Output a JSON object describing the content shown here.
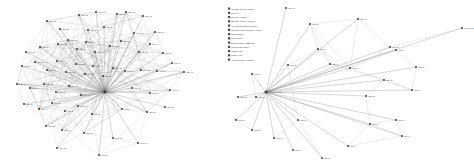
{
  "figure": {
    "background": "#ffffff",
    "panel_count": 2,
    "node_color": "#3a3a3a",
    "edge_color": "#9a9a9a"
  },
  "chart_data": [
    {
      "type": "scatter",
      "id": "left-network",
      "title": "",
      "xlabel": "",
      "ylabel": "",
      "grid": false,
      "legend": "none",
      "description": "Dense force-directed network graph, hairball topology",
      "xlim": [
        0,
        230
      ],
      "ylim": [
        0,
        166
      ],
      "node_count": 62,
      "edge_count": 318,
      "nodes": [
        {
          "id": 0,
          "x": 47,
          "y": 21,
          "label": "node a1"
        },
        {
          "id": 1,
          "x": 79,
          "y": 15,
          "label": "node a2"
        },
        {
          "id": 2,
          "x": 96,
          "y": 12,
          "label": "node a3"
        },
        {
          "id": 3,
          "x": 117,
          "y": 14,
          "label": "node a4"
        },
        {
          "id": 4,
          "x": 126,
          "y": 12,
          "label": "node a5"
        },
        {
          "id": 5,
          "x": 143,
          "y": 16,
          "label": "node a6"
        },
        {
          "id": 6,
          "x": 60,
          "y": 29,
          "label": "node a7"
        },
        {
          "id": 7,
          "x": 88,
          "y": 30,
          "label": "node a8"
        },
        {
          "id": 8,
          "x": 104,
          "y": 27,
          "label": "node a9"
        },
        {
          "id": 9,
          "x": 134,
          "y": 33,
          "label": "node b1"
        },
        {
          "id": 10,
          "x": 155,
          "y": 32,
          "label": "node b2"
        },
        {
          "id": 11,
          "x": 26,
          "y": 52,
          "label": "node b3"
        },
        {
          "id": 12,
          "x": 40,
          "y": 47,
          "label": "node b4"
        },
        {
          "id": 13,
          "x": 58,
          "y": 44,
          "label": "node b5"
        },
        {
          "id": 14,
          "x": 68,
          "y": 40,
          "label": "node b6"
        },
        {
          "id": 15,
          "x": 77,
          "y": 49,
          "label": "node b7"
        },
        {
          "id": 16,
          "x": 86,
          "y": 42,
          "label": "node b8"
        },
        {
          "id": 17,
          "x": 95,
          "y": 52,
          "label": "node b9"
        },
        {
          "id": 18,
          "x": 110,
          "y": 46,
          "label": "node c1"
        },
        {
          "id": 19,
          "x": 121,
          "y": 41,
          "label": "node c2"
        },
        {
          "id": 20,
          "x": 139,
          "y": 52,
          "label": "node c3"
        },
        {
          "id": 21,
          "x": 150,
          "y": 44,
          "label": "node c4"
        },
        {
          "id": 22,
          "x": 163,
          "y": 53,
          "label": "node c5"
        },
        {
          "id": 23,
          "x": 22,
          "y": 66,
          "label": "node c6"
        },
        {
          "id": 24,
          "x": 35,
          "y": 62,
          "label": "node c7"
        },
        {
          "id": 25,
          "x": 47,
          "y": 70,
          "label": "node c8"
        },
        {
          "id": 26,
          "x": 57,
          "y": 61,
          "label": "node c9"
        },
        {
          "id": 27,
          "x": 66,
          "y": 72,
          "label": "node d1"
        },
        {
          "id": 28,
          "x": 76,
          "y": 64,
          "label": "node d2"
        },
        {
          "id": 29,
          "x": 85,
          "y": 74,
          "label": "node d3"
        },
        {
          "id": 30,
          "x": 93,
          "y": 66,
          "label": "node d4"
        },
        {
          "id": 31,
          "x": 103,
          "y": 76,
          "label": "node d5"
        },
        {
          "id": 32,
          "x": 113,
          "y": 68,
          "label": "node d6"
        },
        {
          "id": 33,
          "x": 125,
          "y": 71,
          "label": "node d7"
        },
        {
          "id": 34,
          "x": 141,
          "y": 70,
          "label": "node d8"
        },
        {
          "id": 35,
          "x": 157,
          "y": 71,
          "label": "node d9"
        },
        {
          "id": 36,
          "x": 172,
          "y": 63,
          "label": "node e1"
        },
        {
          "id": 37,
          "x": 184,
          "y": 72,
          "label": "node e2"
        },
        {
          "id": 38,
          "x": 17,
          "y": 84,
          "label": "node e3"
        },
        {
          "id": 39,
          "x": 30,
          "y": 88,
          "label": "node e4"
        },
        {
          "id": 40,
          "x": 44,
          "y": 84,
          "label": "node e5"
        },
        {
          "id": 41,
          "x": 56,
          "y": 92,
          "label": "node e6"
        },
        {
          "id": 42,
          "x": 69,
          "y": 86,
          "label": "node e7"
        },
        {
          "id": 43,
          "x": 81,
          "y": 95,
          "label": "node e8"
        },
        {
          "id": 44,
          "x": 105,
          "y": 92,
          "label": "hub node"
        },
        {
          "id": 45,
          "x": 132,
          "y": 88,
          "label": "node e9"
        },
        {
          "id": 46,
          "x": 150,
          "y": 93,
          "label": "node f1"
        },
        {
          "id": 47,
          "x": 170,
          "y": 90,
          "label": "node f2"
        },
        {
          "id": 48,
          "x": 24,
          "y": 104,
          "label": "node f3"
        },
        {
          "id": 49,
          "x": 39,
          "y": 109,
          "label": "node f4"
        },
        {
          "id": 50,
          "x": 52,
          "y": 103,
          "label": "node f5"
        },
        {
          "id": 51,
          "x": 65,
          "y": 111,
          "label": "node f6"
        },
        {
          "id": 52,
          "x": 78,
          "y": 106,
          "label": "node f7"
        },
        {
          "id": 53,
          "x": 92,
          "y": 114,
          "label": "node f8"
        },
        {
          "id": 54,
          "x": 122,
          "y": 109,
          "label": "node f9"
        },
        {
          "id": 55,
          "x": 147,
          "y": 112,
          "label": "node g1"
        },
        {
          "id": 56,
          "x": 165,
          "y": 107,
          "label": "node g2"
        },
        {
          "id": 57,
          "x": 46,
          "y": 126,
          "label": "node g3"
        },
        {
          "id": 58,
          "x": 62,
          "y": 130,
          "label": "node g4"
        },
        {
          "id": 59,
          "x": 84,
          "y": 133,
          "label": "node g5"
        },
        {
          "id": 60,
          "x": 113,
          "y": 138,
          "label": "node g6"
        },
        {
          "id": 61,
          "x": 138,
          "y": 143,
          "label": "node g7"
        },
        {
          "id": 62,
          "x": 57,
          "y": 148,
          "label": "node g8"
        },
        {
          "id": 63,
          "x": 99,
          "y": 155,
          "label": "node g9"
        }
      ]
    },
    {
      "type": "scatter",
      "id": "right-network",
      "title": "",
      "xlabel": "",
      "ylabel": "",
      "grid": false,
      "legend": "upper-left",
      "description": "Sparse hub-and-spoke network graph with category legend",
      "xlim": [
        0,
        244
      ],
      "ylim": [
        0,
        166
      ],
      "node_count": 28,
      "edge_count": 56,
      "nodes": [
        {
          "id": 0,
          "x": 36,
          "y": 92,
          "label": "central hub node"
        },
        {
          "id": 1,
          "x": 120,
          "y": 68,
          "label": "node r1"
        },
        {
          "id": 2,
          "x": 80,
          "y": 24,
          "label": "node r2"
        },
        {
          "id": 3,
          "x": 128,
          "y": 19,
          "label": "node r3"
        },
        {
          "id": 4,
          "x": 88,
          "y": 49,
          "label": "node r4"
        },
        {
          "id": 5,
          "x": 58,
          "y": 65,
          "label": "node r5"
        },
        {
          "id": 6,
          "x": 100,
          "y": 64,
          "label": "node r6"
        },
        {
          "id": 7,
          "x": 166,
          "y": 50,
          "label": "node r7"
        },
        {
          "id": 8,
          "x": 186,
          "y": 67,
          "label": "node r8"
        },
        {
          "id": 9,
          "x": 182,
          "y": 90,
          "label": "node r9"
        },
        {
          "id": 10,
          "x": 154,
          "y": 80,
          "label": "node s1"
        },
        {
          "id": 11,
          "x": 136,
          "y": 96,
          "label": "node s2"
        },
        {
          "id": 12,
          "x": 232,
          "y": 28,
          "label": "outlier node"
        },
        {
          "id": 13,
          "x": 160,
          "y": 47,
          "label": "node s3"
        },
        {
          "id": 14,
          "x": 22,
          "y": 74,
          "label": "node s4"
        },
        {
          "id": 15,
          "x": 8,
          "y": 97,
          "label": "node s5"
        },
        {
          "id": 16,
          "x": 26,
          "y": 97,
          "label": "node s6"
        },
        {
          "id": 17,
          "x": 6,
          "y": 120,
          "label": "node s7"
        },
        {
          "id": 18,
          "x": 22,
          "y": 130,
          "label": "node s8"
        },
        {
          "id": 19,
          "x": 44,
          "y": 138,
          "label": "node s9"
        },
        {
          "id": 20,
          "x": 63,
          "y": 150,
          "label": "node t1"
        },
        {
          "id": 21,
          "x": 68,
          "y": 120,
          "label": "node t2"
        },
        {
          "id": 22,
          "x": 92,
          "y": 158,
          "label": "node t3"
        },
        {
          "id": 23,
          "x": 118,
          "y": 146,
          "label": "node t4"
        },
        {
          "id": 24,
          "x": 140,
          "y": 124,
          "label": "node t5"
        },
        {
          "id": 25,
          "x": 166,
          "y": 120,
          "label": "node t6"
        },
        {
          "id": 26,
          "x": 172,
          "y": 136,
          "label": "node t7"
        },
        {
          "id": 27,
          "x": 56,
          "y": 8,
          "label": "node t8"
        }
      ],
      "legend_entries": [
        {
          "label": "Network Security Course",
          "color": "#4a4a4a"
        },
        {
          "label": "Privacy",
          "color": "#4a4a4a"
        },
        {
          "label": "Security Analysis",
          "color": "#4a4a4a"
        },
        {
          "label": "Network Security Concept",
          "color": "#4a4a4a"
        },
        {
          "label": "Wireless Over Data System",
          "color": "#4a4a4a"
        },
        {
          "label": "Practical Design Network Access",
          "color": "#4a4a4a"
        },
        {
          "label": "Data Sharing",
          "color": "#4a4a4a"
        },
        {
          "label": "Data Internet",
          "color": "#4a4a4a"
        },
        {
          "label": "Design Model Framework",
          "color": "#4a4a4a"
        },
        {
          "label": "Concept Extension",
          "color": "#4a4a4a"
        },
        {
          "label": "Mobile Code",
          "color": "#4a4a4a"
        },
        {
          "label": "Mobile Host",
          "color": "#4a4a4a"
        },
        {
          "label": "Attack Network Analysis",
          "color": "#4a4a4a"
        }
      ]
    }
  ]
}
